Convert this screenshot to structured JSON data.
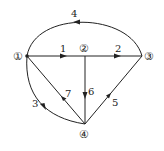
{
  "diagram": {
    "type": "directed-graph",
    "nodes": [
      {
        "id": "1",
        "label": "①",
        "x": 20,
        "y": 57
      },
      {
        "id": "2",
        "label": "②",
        "x": 85,
        "y": 50
      },
      {
        "id": "3",
        "label": "③",
        "x": 150,
        "y": 57
      },
      {
        "id": "4",
        "label": "④",
        "x": 85,
        "y": 132
      }
    ],
    "edges": [
      {
        "id": "e1",
        "label": "1",
        "from": "1",
        "to": "2"
      },
      {
        "id": "e2",
        "label": "2",
        "from": "2",
        "to": "3"
      },
      {
        "id": "e3",
        "label": "3",
        "from": "1",
        "to": "4"
      },
      {
        "id": "e4",
        "label": "4",
        "from": "3",
        "to": "1"
      },
      {
        "id": "e5",
        "label": "5",
        "from": "4",
        "to": "3"
      },
      {
        "id": "e6",
        "label": "6",
        "from": "2",
        "to": "4"
      },
      {
        "id": "e7",
        "label": "7",
        "from": "4",
        "to": "1"
      }
    ],
    "colors": {
      "line": "#222222",
      "background": "#ffffff"
    }
  }
}
